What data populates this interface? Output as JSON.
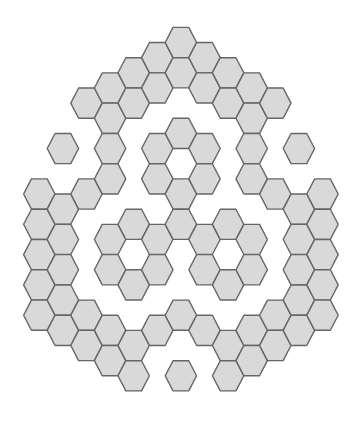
{
  "figure": {
    "background": "#ffffff",
    "hex_fill": "#d9d9d9",
    "hex_stroke": "#666666",
    "grid": {
      "orientation": "flat-top",
      "origin_x": 39.3,
      "origin_y": 42.5,
      "col_step": 23.6,
      "half_row_step": 15.15,
      "half_width": 15.7,
      "half_height": 15.1
    },
    "columns": [
      {
        "col": 0,
        "rows": [
          10,
          12,
          14,
          16,
          18
        ]
      },
      {
        "col": 1,
        "rows": [
          7,
          11,
          13,
          15,
          17,
          19
        ]
      },
      {
        "col": 2,
        "rows": [
          4,
          10,
          18,
          20
        ]
      },
      {
        "col": 3,
        "rows": [
          3,
          5,
          7,
          9,
          13,
          15,
          19,
          21
        ]
      },
      {
        "col": 4,
        "rows": [
          2,
          4,
          12,
          16,
          20,
          22
        ]
      },
      {
        "col": 5,
        "rows": [
          1,
          3,
          7,
          9,
          13,
          15,
          19
        ]
      },
      {
        "col": 6,
        "rows": [
          0,
          2,
          6,
          10,
          12,
          18,
          22
        ]
      },
      {
        "col": 7,
        "rows": [
          1,
          3,
          7,
          9,
          13,
          15,
          19
        ]
      },
      {
        "col": 8,
        "rows": [
          2,
          4,
          12,
          16,
          20,
          22
        ]
      },
      {
        "col": 9,
        "rows": [
          3,
          5,
          7,
          9,
          13,
          15,
          19,
          21
        ]
      },
      {
        "col": 10,
        "rows": [
          4,
          10,
          18,
          20
        ]
      },
      {
        "col": 11,
        "rows": [
          7,
          11,
          13,
          15,
          17,
          19
        ]
      },
      {
        "col": 12,
        "rows": [
          10,
          12,
          14,
          16,
          18
        ]
      }
    ],
    "hex_count": 79
  }
}
